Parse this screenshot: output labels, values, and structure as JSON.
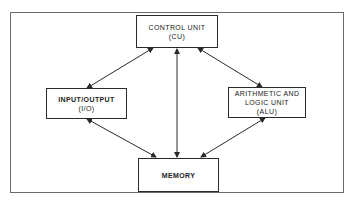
{
  "diagram": {
    "nodes": [
      {
        "id": "cu",
        "lines": [
          "CONTROL UNIT",
          "(CU)"
        ]
      },
      {
        "id": "io",
        "lines": [
          "INPUT/OUTPUT",
          "(I/O)"
        ]
      },
      {
        "id": "alu",
        "lines": [
          "ARITHMETIC AND",
          "LOGIC UNIT",
          "(ALU)"
        ]
      },
      {
        "id": "memory",
        "lines": [
          "MEMORY"
        ]
      }
    ],
    "edges": [
      {
        "from": "cu",
        "to": "io",
        "direction": "bidirectional"
      },
      {
        "from": "cu",
        "to": "alu",
        "direction": "bidirectional"
      },
      {
        "from": "cu",
        "to": "memory",
        "direction": "bidirectional"
      },
      {
        "from": "io",
        "to": "memory",
        "direction": "bidirectional"
      },
      {
        "from": "alu",
        "to": "memory",
        "direction": "bidirectional"
      }
    ],
    "colors": {
      "line": "#2a2a2a",
      "frame": "#6a6a6a",
      "background": "#ffffff"
    }
  }
}
